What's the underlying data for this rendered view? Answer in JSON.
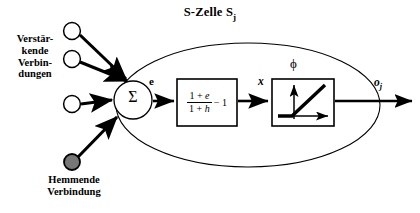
{
  "diagram": {
    "title": {
      "text": "S-Zelle S",
      "subscript": "j"
    },
    "type": "neural-cell-block-diagram",
    "labels": {
      "excitatory_connections": "Verstär-\nkende\nVerbin-\ndungen",
      "inhibitory_connection": "Hemmende\nVerbindung",
      "summation_symbol": "Σ",
      "sum_output_signal": "e",
      "transfer_output_signal": "x",
      "activation_symbol": "ϕ",
      "cell_output": {
        "text": "o",
        "subscript": "j"
      }
    },
    "formula": {
      "numerator": "1 + e",
      "denominator": "1 + h",
      "trailing_term": "− 1",
      "plain": "(1 + e) / (1 + h) − 1"
    },
    "activation_box": {
      "function": "piecewise-linear ramp",
      "axes": [
        "vertical-axis-arrow",
        "horizontal-axis-arrow"
      ],
      "curve": "flat then linear rising"
    },
    "nodes": {
      "excitatory_count": 3,
      "excitatory_style": "hollow-circle",
      "inhibitory_count": 1,
      "inhibitory_style": "filled-circle"
    },
    "colors": {
      "stroke": "#000000",
      "background": "#ffffff",
      "node_fill": "#ffffff",
      "inhibitory_fill": "#777777"
    }
  }
}
